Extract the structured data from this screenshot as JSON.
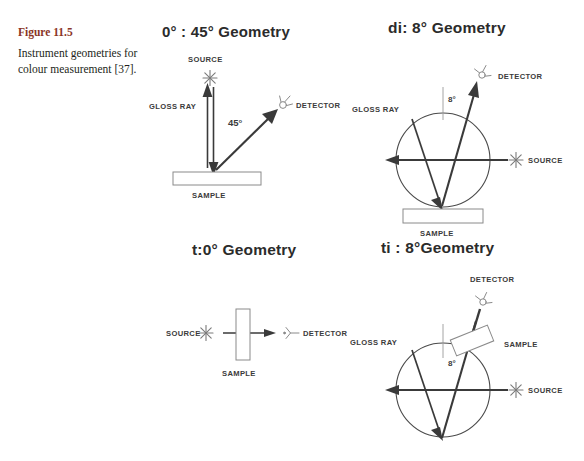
{
  "figure": {
    "number_label": "Figure 11.5",
    "caption": "Instrument geometries for colour measurement [37].",
    "accent_color": "#8a3527"
  },
  "panels": [
    {
      "id": "0-45",
      "title": "0° : 45°  Geometry",
      "labels": {
        "source": "SOURCE",
        "detector": "DETECTOR",
        "gloss_ray": "GLOSS RAY",
        "sample": "SAMPLE",
        "angle": "45°"
      }
    },
    {
      "id": "di-8",
      "title": "di: 8°  Geometry",
      "labels": {
        "source": "SOURCE",
        "detector": "DETECTOR",
        "gloss_ray": "GLOSS RAY",
        "sample": "SAMPLE",
        "angle": "8°"
      }
    },
    {
      "id": "t-0",
      "title": "t:0°  Geometry",
      "labels": {
        "source": "SOURCE",
        "detector": "DETECTOR",
        "sample": "SAMPLE"
      }
    },
    {
      "id": "ti-8",
      "title": "ti :  8°Geometry",
      "labels": {
        "source": "SOURCE",
        "detector": "DETECTOR",
        "gloss_ray": "GLOSS RAY",
        "sample": "SAMPLE",
        "angle": "8°"
      }
    }
  ]
}
